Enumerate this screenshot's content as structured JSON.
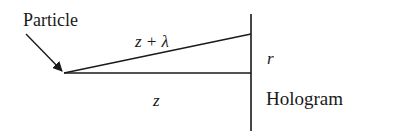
{
  "diagram": {
    "labels": {
      "particle": "Particle",
      "slant_path": "z + λ",
      "direct_path": "z",
      "radius": "r",
      "hologram": "Hologram"
    },
    "colors": {
      "line": "#1a1a1a",
      "background": "#ffffff"
    }
  }
}
